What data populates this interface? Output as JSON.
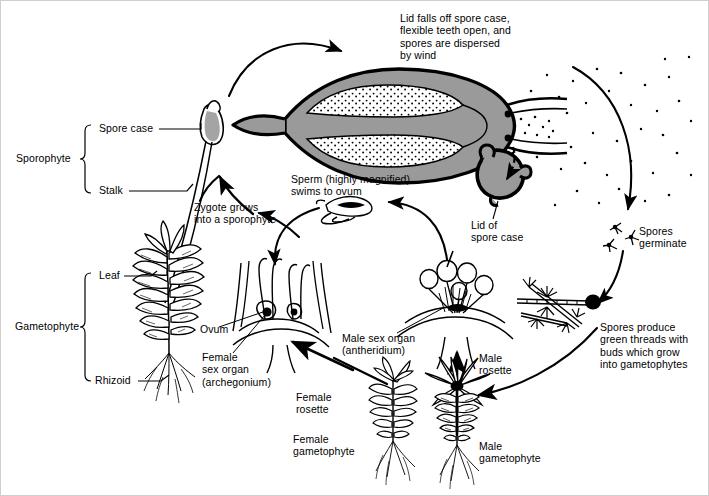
{
  "figure": {
    "type": "biological-cycle-diagram",
    "width": 709,
    "height": 496,
    "ink_color": "#000000",
    "fill_gray": "#9a9a9a",
    "background": "#ffffff"
  },
  "labels": {
    "lid_falls": "Lid falls off spore case,\nflexible teeth open, and\nspores are dispersed\nby wind",
    "lid_of_spore_case": "Lid of\nspore case",
    "spores_germinate": "Spores\ngerminate",
    "spores_produce": "Spores produce\ngreen threads with\nbuds which grow\ninto gametophytes",
    "sperm": "Sperm (highly magnified)\nswims to ovum",
    "zygote": "Zygote grows\ninto a sporophyte",
    "ovum": "Ovum",
    "female_sex_organ": "Female\nsex organ\n(archegonium)",
    "male_sex_organ": "Male sex organ\n(antheridium)",
    "female_rosette": "Female\nrosette",
    "female_gametophyte": "Female\ngametophyte",
    "male_rosette": "Male\nrosette",
    "male_gametophyte": "Male\ngametophyte"
  },
  "brackets": {
    "sporophyte": {
      "name": "Sporophyte",
      "parts": [
        "Spore case",
        "Stalk"
      ]
    },
    "gametophyte": {
      "name": "Gametophyte",
      "parts": [
        "Leaf",
        "Rhizoid"
      ]
    }
  },
  "bracket_text": {
    "sporophyte": "Sporophyte",
    "spore_case": "Spore case",
    "stalk": "Stalk",
    "gametophyte": "Gametophyte",
    "leaf": "Leaf",
    "rhizoid": "Rhizoid"
  },
  "stages": [
    {
      "id": "sporophyte-capsule",
      "label": "Spore case (capsule) cross-section"
    },
    {
      "id": "lid",
      "label": "Lid of spore case"
    },
    {
      "id": "spore-cloud",
      "label": "Dispersed spores"
    },
    {
      "id": "protonema",
      "label": "Green threads with buds"
    },
    {
      "id": "male-gametophyte",
      "label": "Male gametophyte"
    },
    {
      "id": "female-gametophyte",
      "label": "Female gametophyte"
    },
    {
      "id": "antheridium",
      "label": "Male sex organ (antheridium)"
    },
    {
      "id": "archegonium",
      "label": "Female sex organ (archegonium)"
    },
    {
      "id": "sperm",
      "label": "Sperm"
    },
    {
      "id": "mature-sporophyte",
      "label": "Sporophyte on gametophyte"
    }
  ]
}
